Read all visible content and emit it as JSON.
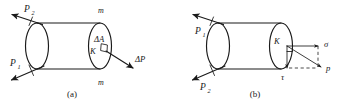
{
  "figure": {
    "background_color": "#ffffff",
    "line_color": "#1a1a1a",
    "width": 345,
    "height": 105,
    "panels": [
      {
        "id": "a",
        "caption": "(a)",
        "description": "Cylindrical bar in tension with an elemental area at cross-section",
        "labels": {
          "force_upper_left": "P",
          "force_upper_left_sub": "2",
          "force_lower_left": "P",
          "force_lower_left_sub": "1",
          "section_top": "m",
          "section_bottom": "m",
          "element_area": "ΔA",
          "point": "K",
          "element_force": "ΔP"
        }
      },
      {
        "id": "b",
        "caption": "(b)",
        "description": "Same cylinder showing total stress p resolved into normal stress sigma and shear stress tau",
        "labels": {
          "force_upper_left": "P",
          "force_upper_left_sub": "1",
          "force_lower_left": "P",
          "force_lower_left_sub": "2",
          "point": "K",
          "normal_stress": "σ",
          "shear_stress": "τ",
          "total_stress": "p"
        }
      }
    ]
  }
}
